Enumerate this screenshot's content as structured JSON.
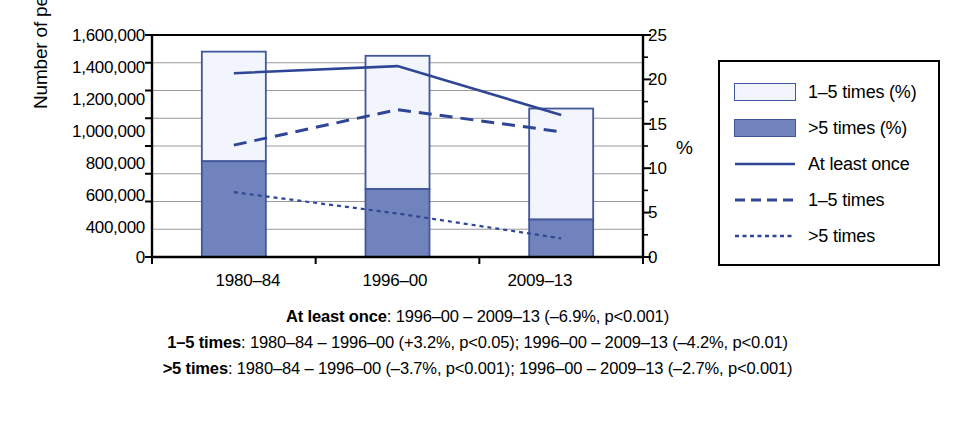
{
  "chart_data": {
    "type": "bar",
    "title": "",
    "subtitle": "",
    "categories": [
      "1980–84",
      "1996–00",
      "2009–13"
    ],
    "ylabel": "Number of people",
    "y2label": "%",
    "xlabel": "",
    "ylim": [
      0,
      1600000
    ],
    "y2lim": [
      0,
      25
    ],
    "grid": true,
    "legend_position": "right",
    "y_ticks": [
      "0",
      "400,000",
      "600,000",
      "800,000",
      "1,000,000",
      "1,200,000",
      "1,400,000",
      "1,600,000"
    ],
    "y_tick_values": [
      0,
      400000,
      600000,
      800000,
      1000000,
      1200000,
      1400000,
      1600000
    ],
    "y_gridline_values": [
      200000,
      400000,
      600000,
      800000,
      1000000,
      1200000,
      1400000
    ],
    "y2_ticks": [
      "0",
      "5",
      "10",
      "15",
      "20",
      "25"
    ],
    "y2_tick_values": [
      0,
      5,
      10,
      15,
      20,
      25
    ],
    "y2_minor_tick_values": [
      2.5,
      7.5,
      12.5,
      17.5,
      22.5
    ],
    "bar_series": [
      {
        "name": "1–5 times (%)",
        "stack_segment": "upper",
        "fill": "#f2f6fc",
        "stroke": "#42569b",
        "values": [
          790000,
          960000,
          800000
        ],
        "cumulative_top": [
          1480000,
          1450000,
          1070000
        ]
      },
      {
        "name": ">5 times (%)",
        "stack_segment": "lower",
        "fill": "#7183bd",
        "stroke": "#42569b",
        "values": [
          690000,
          490000,
          270000
        ],
        "cumulative_top": [
          690000,
          490000,
          270000
        ]
      }
    ],
    "line_series": [
      {
        "name": "At least once",
        "axis": "right",
        "style": "solid",
        "color": "#2f4595",
        "values": [
          20.7,
          21.5,
          16.0
        ]
      },
      {
        "name": "1–5 times",
        "axis": "right",
        "style": "dashed",
        "color": "#2f4595",
        "values": [
          12.6,
          16.6,
          14.1
        ]
      },
      {
        "name": ">5 times",
        "axis": "right",
        "style": "dotted",
        "color": "#2f4595",
        "values": [
          7.3,
          4.9,
          2.1
        ]
      }
    ],
    "legend_entries": [
      {
        "label": "1–5 times (%)",
        "marker": "swatch-open"
      },
      {
        "label": ">5 times (%)",
        "marker": "swatch-filled"
      },
      {
        "label": "At least once",
        "marker": "line-solid"
      },
      {
        "label": "1–5 times",
        "marker": "line-dashed"
      },
      {
        "label": ">5 times",
        "marker": "line-dotted"
      }
    ],
    "annotations": [
      {
        "series": "At least once",
        "bold": "At least once",
        "rest": ": 1996–00 – 2009–13 (–6.9%, p<0.001)"
      },
      {
        "series": "1–5 times",
        "bold": "1–5 times",
        "rest": ": 1980–84 – 1996–00 (+3.2%, p<0.05); 1996–00 – 2009–13 (–4.2%, p<0.01)"
      },
      {
        "series": ">5 times",
        "bold": ">5 times",
        "rest": ": 1980–84 – 1996–00 (–3.7%, p<0.001); 1996–00 – 2009–13 (–2.7%, p<0.001)"
      }
    ],
    "colors": {
      "bar_stroke": "#42569b",
      "bar_fill_upper": "#f2f6fc",
      "bar_fill_lower": "#7183bd",
      "line": "#2f4595",
      "axis": "#000000",
      "gridline": "#9a9a9a"
    }
  },
  "axis": {
    "y_title": "Number of people",
    "y2_title": "%",
    "ticks_left": [
      "1,600,000",
      "1,400,000",
      "1,200,000",
      "1,000,000",
      "800,000",
      "600,000",
      "400,000",
      "0"
    ],
    "ticks_right": [
      "25",
      "20",
      "15",
      "10",
      "5",
      "0"
    ],
    "ticks_x": [
      "1980–84",
      "1996–00",
      "2009–13"
    ]
  },
  "legend": {
    "items": [
      "1–5 times (%)",
      ">5 times (%)",
      "At least once",
      "1–5 times",
      ">5 times"
    ]
  },
  "caption": {
    "lines": [
      {
        "bold": "At least once",
        "rest": ": 1996–00 – 2009–13 (–6.9%, p<0.001)"
      },
      {
        "bold": "1–5 times",
        "rest": ": 1980–84 – 1996–00 (+3.2%, p<0.05); 1996–00 – 2009–13 (–4.2%, p<0.01)"
      },
      {
        "bold": ">5 times",
        "rest": ": 1980–84 – 1996–00 (–3.7%, p<0.001); 1996–00 – 2009–13 (–2.7%, p<0.001)"
      }
    ]
  }
}
